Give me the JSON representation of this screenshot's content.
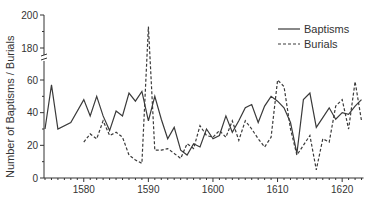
{
  "chart_data": {
    "type": "line",
    "title": "",
    "xlabel": "",
    "ylabel": "Number of Baptisms / Burials",
    "y_axis": {
      "broken": true,
      "lower_range": [
        0,
        60
      ],
      "upper_range": [
        180,
        200
      ],
      "ticks": [
        0,
        20,
        40,
        60,
        180,
        200
      ]
    },
    "x_axis": {
      "range": [
        1574,
        1623
      ],
      "ticks": [
        1580,
        1590,
        1600,
        1610,
        1620
      ],
      "minor_tick_step": 1
    },
    "grid": false,
    "legend_position": "upper right",
    "series": [
      {
        "name": "Baptisms",
        "style": "solid",
        "points": [
          [
            1574,
            30
          ],
          [
            1575,
            57
          ],
          [
            1576,
            30
          ],
          [
            1578,
            34
          ],
          [
            1580,
            48
          ],
          [
            1581,
            38
          ],
          [
            1582,
            50
          ],
          [
            1583,
            38
          ],
          [
            1584,
            29
          ],
          [
            1585,
            41
          ],
          [
            1586,
            38
          ],
          [
            1587,
            52
          ],
          [
            1588,
            47
          ],
          [
            1589,
            53
          ],
          [
            1590,
            35
          ],
          [
            1591,
            50
          ],
          [
            1592,
            36
          ],
          [
            1593,
            24
          ],
          [
            1594,
            31
          ],
          [
            1595,
            17
          ],
          [
            1596,
            14
          ],
          [
            1597,
            21
          ],
          [
            1598,
            19
          ],
          [
            1599,
            30
          ],
          [
            1600,
            24
          ],
          [
            1601,
            26
          ],
          [
            1602,
            38
          ],
          [
            1603,
            28
          ],
          [
            1604,
            35
          ],
          [
            1605,
            43
          ],
          [
            1606,
            45
          ],
          [
            1607,
            34
          ],
          [
            1608,
            44
          ],
          [
            1609,
            50
          ],
          [
            1610,
            47
          ],
          [
            1611,
            43
          ],
          [
            1612,
            34
          ],
          [
            1613,
            15
          ],
          [
            1614,
            48
          ],
          [
            1615,
            52
          ],
          [
            1616,
            31
          ],
          [
            1617,
            37
          ],
          [
            1618,
            43
          ],
          [
            1619,
            36
          ],
          [
            1620,
            40
          ],
          [
            1621,
            39
          ],
          [
            1622,
            44
          ],
          [
            1623,
            48
          ]
        ]
      },
      {
        "name": "Burials",
        "style": "dashed",
        "points": [
          [
            1580,
            22
          ],
          [
            1581,
            27
          ],
          [
            1582,
            24
          ],
          [
            1583,
            35
          ],
          [
            1584,
            26
          ],
          [
            1585,
            28
          ],
          [
            1586,
            25
          ],
          [
            1587,
            14
          ],
          [
            1588,
            11
          ],
          [
            1589,
            9
          ],
          [
            1590,
            193
          ],
          [
            1591,
            17
          ],
          [
            1592,
            17
          ],
          [
            1593,
            18
          ],
          [
            1594,
            15
          ],
          [
            1595,
            12
          ],
          [
            1596,
            21
          ],
          [
            1597,
            18
          ],
          [
            1598,
            32
          ],
          [
            1599,
            26
          ],
          [
            1600,
            25
          ],
          [
            1601,
            29
          ],
          [
            1602,
            25
          ],
          [
            1603,
            35
          ],
          [
            1604,
            23
          ],
          [
            1605,
            35
          ],
          [
            1606,
            30
          ],
          [
            1607,
            24
          ],
          [
            1608,
            19
          ],
          [
            1609,
            25
          ],
          [
            1610,
            60
          ],
          [
            1611,
            56
          ],
          [
            1612,
            30
          ],
          [
            1613,
            14
          ],
          [
            1614,
            20
          ],
          [
            1615,
            26
          ],
          [
            1616,
            5
          ],
          [
            1617,
            24
          ],
          [
            1618,
            22
          ],
          [
            1619,
            44
          ],
          [
            1620,
            48
          ],
          [
            1621,
            30
          ],
          [
            1622,
            59
          ],
          [
            1623,
            35
          ]
        ]
      }
    ]
  },
  "legend": {
    "items": [
      {
        "label": "Baptisms",
        "style": "solid"
      },
      {
        "label": "Burials",
        "style": "dashed"
      }
    ]
  },
  "axes": {
    "y_tick_labels": [
      "200",
      "180",
      "60",
      "40",
      "20",
      "0"
    ],
    "x_tick_labels": [
      "1580",
      "1590",
      "1600",
      "1610",
      "1620"
    ],
    "ylabel": "Number of Baptisms / Burials"
  },
  "colors": {
    "line": "#3a3a3a",
    "axis": "#333333",
    "text": "#333333"
  }
}
